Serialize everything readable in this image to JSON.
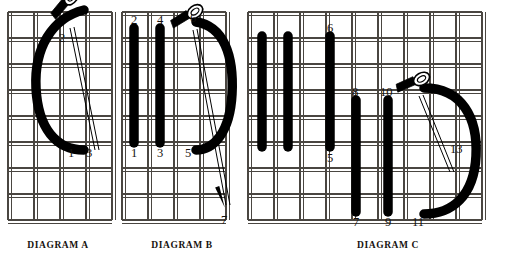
{
  "figure": {
    "background_color": "#ffffff",
    "thread_color": "#000000",
    "grid_color": "#4a4641",
    "label_color": "#16120e"
  },
  "diagrams": [
    {
      "id": "A",
      "caption": "DIAGRAM A",
      "caption_x": 58,
      "caption_y": 246,
      "grid": {
        "x": 8,
        "y": 12,
        "cols": 4,
        "rows": 8,
        "cell": 26
      },
      "stitches": [],
      "curve_thread": {
        "path": "M 84 10 C 52 18, 34 48, 36 88 C 38 128, 56 150, 84 150"
      },
      "needle": {
        "x": 64,
        "y": 4,
        "angle": -38
      },
      "labels": [
        {
          "text": "2",
          "x": 59,
          "y": 42
        },
        {
          "text": "1",
          "x": 68,
          "y": 157
        },
        {
          "text": "3",
          "x": 86,
          "y": 157
        }
      ]
    },
    {
      "id": "B",
      "caption": "DIAGRAM B",
      "caption_x": 182,
      "caption_y": 246,
      "grid": {
        "x": 122,
        "y": 12,
        "cols": 4,
        "rows": 8,
        "cell": 26
      },
      "stitches": [
        {
          "x": 134,
          "y1": 28,
          "y2": 143,
          "top_label": "2",
          "bottom_label": "1"
        },
        {
          "x": 160,
          "y1": 28,
          "y2": 143,
          "top_label": "4",
          "bottom_label": "3"
        }
      ],
      "curve_thread": {
        "path": "M 196 22 C 224 26, 234 56, 232 94 C 230 132, 214 150, 196 150"
      },
      "needle": {
        "x": 186,
        "y": 16,
        "angle": -20
      },
      "needle_tip": {
        "x": 222,
        "y": 200,
        "angle": 70
      },
      "labels": [
        {
          "text": "2",
          "x": 131,
          "y": 24
        },
        {
          "text": "4",
          "x": 157,
          "y": 24
        },
        {
          "text": "6",
          "x": 190,
          "y": 22
        },
        {
          "text": "1",
          "x": 131,
          "y": 157
        },
        {
          "text": "3",
          "x": 157,
          "y": 157
        },
        {
          "text": "5",
          "x": 185,
          "y": 157
        },
        {
          "text": "7",
          "x": 221,
          "y": 224
        }
      ]
    },
    {
      "id": "C",
      "caption": "DIAGRAM C",
      "caption_x": 388,
      "caption_y": 246,
      "grid": {
        "x": 248,
        "y": 12,
        "cols": 9,
        "rows": 8,
        "cell": 26
      },
      "stitches": [
        {
          "x": 262,
          "y1": 36,
          "y2": 147,
          "top_label": "",
          "bottom_label": ""
        },
        {
          "x": 288,
          "y1": 36,
          "y2": 147,
          "top_label": "",
          "bottom_label": ""
        },
        {
          "x": 330,
          "y1": 36,
          "y2": 147,
          "top_label": "6",
          "bottom_label": "5"
        },
        {
          "x": 356,
          "y1": 100,
          "y2": 212,
          "top_label": "8",
          "bottom_label": "7"
        },
        {
          "x": 388,
          "y1": 100,
          "y2": 212,
          "top_label": "10",
          "bottom_label": "9"
        }
      ],
      "curve_thread": {
        "path": "M 424 88 C 462 88, 478 118, 476 156 C 474 196, 452 214, 424 214"
      },
      "needle": {
        "x": 412,
        "y": 82,
        "angle": -12
      },
      "labels": [
        {
          "text": "6",
          "x": 327,
          "y": 32
        },
        {
          "text": "5",
          "x": 327,
          "y": 162
        },
        {
          "text": "8",
          "x": 352,
          "y": 96
        },
        {
          "text": "10",
          "x": 380,
          "y": 96
        },
        {
          "text": "7",
          "x": 353,
          "y": 226
        },
        {
          "text": "9",
          "x": 385,
          "y": 226
        },
        {
          "text": "11",
          "x": 412,
          "y": 226
        },
        {
          "text": "13",
          "x": 450,
          "y": 153
        }
      ]
    }
  ],
  "captions": {
    "a": "DIAGRAM A",
    "b": "DIAGRAM B",
    "c": "DIAGRAM C"
  }
}
